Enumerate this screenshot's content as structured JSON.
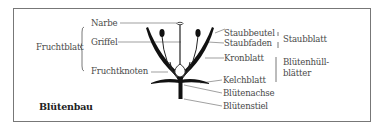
{
  "diagram": {
    "title": "Blütenbau",
    "left_labels": {
      "group": "Fruchtblatt",
      "narbe": "Narbe",
      "griffel": "Griffel",
      "fruchtknoten": "Fruchtknoten"
    },
    "right_labels": {
      "staubbeutel": "Staubbeutel",
      "staubfaden": "Staubfaden",
      "kronblatt": "Kronblatt",
      "kelchblatt": "Kelchblatt",
      "bluetenachse": "Blütenachse",
      "bluetenstiel": "Blütenstiel"
    },
    "groups": {
      "staubblatt": "Staubblatt",
      "bluetenhuell_1": "Blütenhüll-",
      "bluetenhuell_2": "blätter"
    }
  }
}
